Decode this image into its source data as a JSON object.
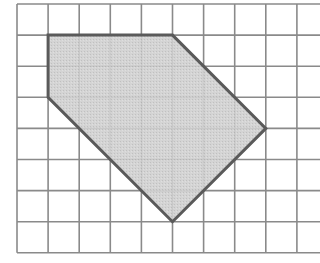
{
  "diagram": {
    "type": "grid-polygon",
    "grid": {
      "origin_px": [
        17,
        4
      ],
      "cell_px": 31.1,
      "columns": 10,
      "rows": 8,
      "line_color": "#8a8a8a",
      "background": "#ffffff"
    },
    "shape": {
      "name": "shaded-pentagon",
      "vertices_grid": [
        [
          1,
          1
        ],
        [
          5,
          1
        ],
        [
          8,
          4
        ],
        [
          5,
          7
        ],
        [
          1,
          3
        ]
      ],
      "fill": "#c8c8c8",
      "stroke": "#5a5a5a",
      "stroke_width": 3
    }
  }
}
